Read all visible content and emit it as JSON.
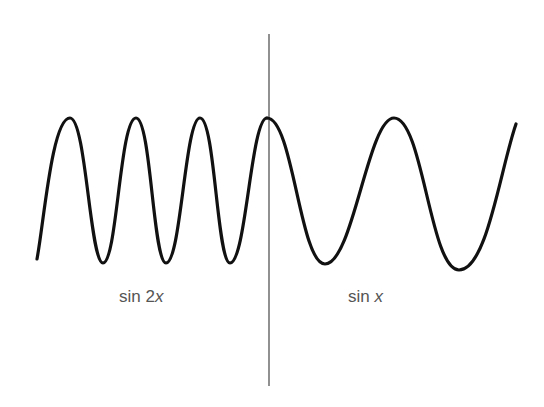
{
  "figure": {
    "colors": {
      "background": "#ffffff",
      "curve": "#111111",
      "divider": "#555555",
      "label": "#555555"
    },
    "divider": {
      "x": 269,
      "y_top": 34,
      "y_bottom": 386
    },
    "curves": [
      {
        "name": "sin 2x",
        "region": "left",
        "start": [
          37,
          259
        ],
        "peaks_x": [
          70,
          136,
          200,
          267
        ],
        "troughs_x": [
          103,
          166,
          230
        ],
        "peak_y": 118,
        "trough_y": 263
      },
      {
        "name": "sin x",
        "region": "right",
        "start": [
          267,
          118
        ],
        "peaks_x": [
          394
        ],
        "troughs_x": [
          325,
          459
        ],
        "peak_y": 118,
        "trough_y": 268,
        "end": [
          516,
          124
        ]
      }
    ],
    "labels": {
      "left": {
        "prefix": "sin 2",
        "var": "x"
      },
      "right": {
        "prefix": "sin ",
        "var": "x"
      }
    }
  }
}
